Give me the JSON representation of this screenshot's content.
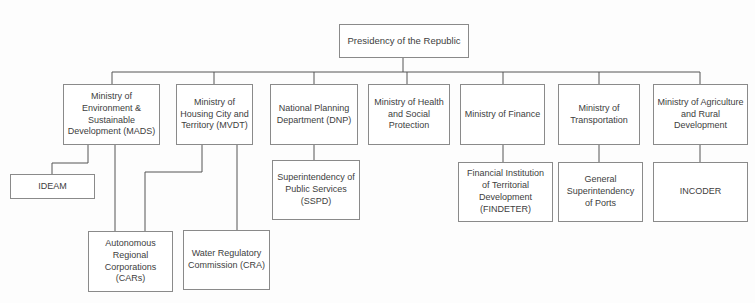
{
  "diagram": {
    "colors": {
      "background": "#fdfdfd",
      "box_fill": "#ffffff",
      "box_border": "#8a8a8a",
      "connector_line": "#555555",
      "text": "#404040"
    },
    "nodes": {
      "presidency": {
        "label": "Presidency of the Republic"
      },
      "mads": {
        "label": "Ministry of Environment & Sustainable Development (MADS)"
      },
      "mvdt": {
        "label": "Ministry of Housing City and Territory (MVDT)"
      },
      "dnp": {
        "label": "National Planning Department (DNP)"
      },
      "health": {
        "label": "Ministry of Health and Social Protection"
      },
      "finance": {
        "label": "Ministry of Finance"
      },
      "transportation": {
        "label": "Ministry of Transportation"
      },
      "agriculture": {
        "label": "Ministry of Agriculture and Rural Development"
      },
      "ideam": {
        "label": "IDEAM"
      },
      "sspd": {
        "label": "Superintendency of Public Services (SSPD)"
      },
      "findeter": {
        "label": "Financial Institution of Territorial Development (FINDETER)"
      },
      "ports": {
        "label": "General Superintendency of Ports"
      },
      "incoder": {
        "label": "INCODER"
      },
      "cars": {
        "label": "Autonomous Regional Corporations (CARs)"
      },
      "cra": {
        "label": "Water Regulatory Commission (CRA)"
      }
    },
    "edges": [
      {
        "from": "presidency",
        "to": "mads"
      },
      {
        "from": "presidency",
        "to": "mvdt"
      },
      {
        "from": "presidency",
        "to": "dnp"
      },
      {
        "from": "presidency",
        "to": "health"
      },
      {
        "from": "presidency",
        "to": "finance"
      },
      {
        "from": "presidency",
        "to": "transportation"
      },
      {
        "from": "presidency",
        "to": "agriculture"
      },
      {
        "from": "mads",
        "to": "ideam"
      },
      {
        "from": "mads",
        "to": "cars"
      },
      {
        "from": "mvdt",
        "to": "cars"
      },
      {
        "from": "mvdt",
        "to": "cra"
      },
      {
        "from": "dnp",
        "to": "sspd"
      },
      {
        "from": "finance",
        "to": "findeter"
      },
      {
        "from": "transportation",
        "to": "ports"
      },
      {
        "from": "agriculture",
        "to": "incoder"
      }
    ]
  }
}
